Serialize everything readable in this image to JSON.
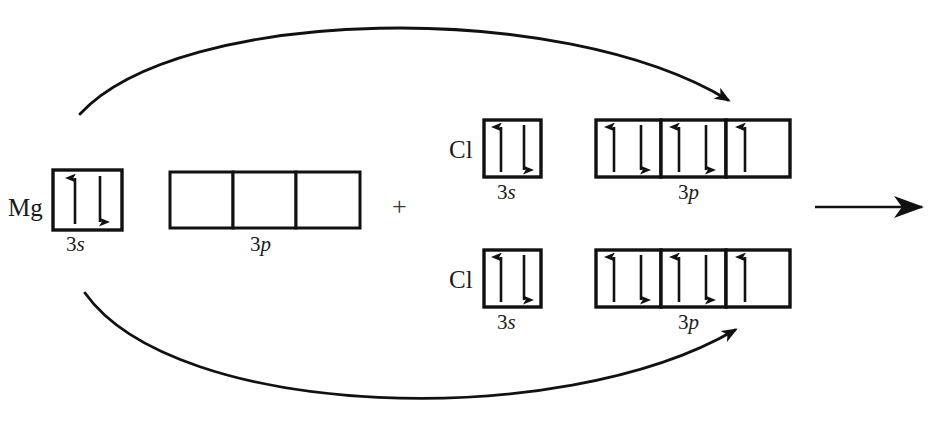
{
  "diagram": {
    "type": "orbital-box-diagram",
    "ink_color": "#111111",
    "reactants": [
      {
        "id": "mg",
        "symbol": "Mg",
        "orbitals": [
          {
            "name": "3s",
            "principal": "3",
            "subshell": "s",
            "boxes": [
              {
                "electrons": [
                  "up",
                  "down"
                ]
              }
            ]
          },
          {
            "name": "3p",
            "principal": "3",
            "subshell": "p",
            "boxes": [
              {
                "electrons": []
              },
              {
                "electrons": []
              },
              {
                "electrons": []
              }
            ]
          }
        ]
      },
      {
        "id": "cl-top",
        "symbol": "Cl",
        "orbitals": [
          {
            "name": "3s",
            "principal": "3",
            "subshell": "s",
            "boxes": [
              {
                "electrons": [
                  "up",
                  "down"
                ]
              }
            ]
          },
          {
            "name": "3p",
            "principal": "3",
            "subshell": "p",
            "boxes": [
              {
                "electrons": [
                  "up",
                  "down"
                ]
              },
              {
                "electrons": [
                  "up",
                  "down"
                ]
              },
              {
                "electrons": [
                  "up"
                ]
              }
            ]
          }
        ]
      },
      {
        "id": "cl-bottom",
        "symbol": "Cl",
        "orbitals": [
          {
            "name": "3s",
            "principal": "3",
            "subshell": "s",
            "boxes": [
              {
                "electrons": [
                  "up",
                  "down"
                ]
              }
            ]
          },
          {
            "name": "3p",
            "principal": "3",
            "subshell": "p",
            "boxes": [
              {
                "electrons": [
                  "up",
                  "down"
                ]
              },
              {
                "electrons": [
                  "up",
                  "down"
                ]
              },
              {
                "electrons": [
                  "up"
                ]
              }
            ]
          }
        ]
      }
    ],
    "operators": {
      "plus": "+"
    },
    "transfer_arrows": [
      {
        "name": "mg-to-cl-top",
        "from": "mg-3s",
        "to": "cl-top-3p-box3",
        "direction": "up-over"
      },
      {
        "name": "mg-to-cl-bottom",
        "from": "mg-3s",
        "to": "cl-bottom-3p-box3",
        "direction": "down-under"
      }
    ],
    "reaction_arrow": {
      "name": "yields-arrow",
      "direction": "right"
    }
  }
}
